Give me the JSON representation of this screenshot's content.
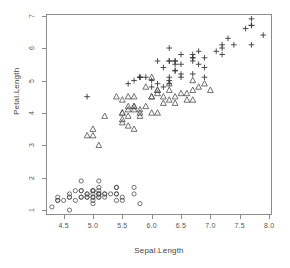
{
  "chart_data": {
    "type": "scatter",
    "title": "",
    "xlabel": "Sepal.Length",
    "ylabel": "Petal.Length",
    "xlim": [
      4.2,
      8.05
    ],
    "ylim": [
      0.85,
      7.05
    ],
    "grid": false,
    "legend": "none",
    "xticks": [
      "4.5",
      "5.0",
      "5.5",
      "6.0",
      "6.5",
      "7.0",
      "7.5",
      "8.0"
    ],
    "xtick_values": [
      4.5,
      5.0,
      5.5,
      6.0,
      6.5,
      7.0,
      7.5,
      8.0
    ],
    "yticks": [
      "1",
      "2",
      "3",
      "4",
      "5",
      "6",
      "7"
    ],
    "ytick_values": [
      1,
      2,
      3,
      4,
      5,
      6,
      7
    ],
    "series": [
      {
        "name": "setosa",
        "marker": "circle",
        "color": "#4d4d4d",
        "points": [
          [
            5.1,
            1.4
          ],
          [
            4.9,
            1.4
          ],
          [
            4.7,
            1.3
          ],
          [
            4.6,
            1.5
          ],
          [
            5.0,
            1.4
          ],
          [
            5.4,
            1.7
          ],
          [
            4.6,
            1.4
          ],
          [
            5.0,
            1.5
          ],
          [
            4.4,
            1.4
          ],
          [
            4.9,
            1.5
          ],
          [
            5.4,
            1.5
          ],
          [
            4.8,
            1.6
          ],
          [
            4.8,
            1.4
          ],
          [
            4.3,
            1.1
          ],
          [
            5.8,
            1.2
          ],
          [
            5.7,
            1.5
          ],
          [
            5.4,
            1.3
          ],
          [
            5.1,
            1.4
          ],
          [
            5.7,
            1.7
          ],
          [
            5.1,
            1.5
          ],
          [
            5.4,
            1.7
          ],
          [
            5.1,
            1.5
          ],
          [
            4.6,
            1.0
          ],
          [
            5.1,
            1.7
          ],
          [
            4.8,
            1.9
          ],
          [
            5.0,
            1.6
          ],
          [
            5.0,
            1.6
          ],
          [
            5.2,
            1.5
          ],
          [
            5.2,
            1.4
          ],
          [
            4.7,
            1.6
          ],
          [
            4.8,
            1.6
          ],
          [
            5.4,
            1.5
          ],
          [
            5.2,
            1.5
          ],
          [
            5.5,
            1.4
          ],
          [
            4.9,
            1.5
          ],
          [
            5.0,
            1.2
          ],
          [
            5.5,
            1.3
          ],
          [
            4.9,
            1.4
          ],
          [
            4.4,
            1.3
          ],
          [
            5.1,
            1.5
          ],
          [
            5.0,
            1.3
          ],
          [
            4.5,
            1.3
          ],
          [
            4.4,
            1.3
          ],
          [
            5.0,
            1.6
          ],
          [
            5.1,
            1.9
          ],
          [
            4.8,
            1.4
          ],
          [
            5.1,
            1.6
          ],
          [
            4.6,
            1.4
          ],
          [
            5.3,
            1.5
          ],
          [
            5.0,
            1.4
          ]
        ]
      },
      {
        "name": "versicolor",
        "marker": "triangle",
        "color": "#4d4d4d",
        "points": [
          [
            7.0,
            4.7
          ],
          [
            6.4,
            4.5
          ],
          [
            6.9,
            4.9
          ],
          [
            5.5,
            4.0
          ],
          [
            6.5,
            4.6
          ],
          [
            5.7,
            4.5
          ],
          [
            6.3,
            4.7
          ],
          [
            4.9,
            3.3
          ],
          [
            6.6,
            4.6
          ],
          [
            5.2,
            3.9
          ],
          [
            5.0,
            3.5
          ],
          [
            5.9,
            4.2
          ],
          [
            6.0,
            4.0
          ],
          [
            6.1,
            4.7
          ],
          [
            5.6,
            3.6
          ],
          [
            6.7,
            4.4
          ],
          [
            5.6,
            4.5
          ],
          [
            5.8,
            4.1
          ],
          [
            6.2,
            4.5
          ],
          [
            5.6,
            3.9
          ],
          [
            5.9,
            4.8
          ],
          [
            6.1,
            4.0
          ],
          [
            6.3,
            4.9
          ],
          [
            6.1,
            4.7
          ],
          [
            6.4,
            4.3
          ],
          [
            6.6,
            4.4
          ],
          [
            6.8,
            4.8
          ],
          [
            6.7,
            5.0
          ],
          [
            6.0,
            4.5
          ],
          [
            5.7,
            3.5
          ],
          [
            5.5,
            3.8
          ],
          [
            5.5,
            3.7
          ],
          [
            5.8,
            3.9
          ],
          [
            6.0,
            5.1
          ],
          [
            5.4,
            4.5
          ],
          [
            6.0,
            4.5
          ],
          [
            6.7,
            4.7
          ],
          [
            6.3,
            4.4
          ],
          [
            5.6,
            4.1
          ],
          [
            5.5,
            4.0
          ],
          [
            5.5,
            4.4
          ],
          [
            6.1,
            4.6
          ],
          [
            5.8,
            4.0
          ],
          [
            5.0,
            3.3
          ],
          [
            5.6,
            4.2
          ],
          [
            5.7,
            4.2
          ],
          [
            5.7,
            4.2
          ],
          [
            6.2,
            4.3
          ],
          [
            5.1,
            3.0
          ],
          [
            5.7,
            4.1
          ]
        ]
      },
      {
        "name": "virginica",
        "marker": "plus",
        "color": "#3a3a3a",
        "points": [
          [
            6.3,
            6.0
          ],
          [
            5.8,
            5.1
          ],
          [
            7.1,
            5.9
          ],
          [
            6.3,
            5.6
          ],
          [
            6.5,
            5.8
          ],
          [
            7.6,
            6.6
          ],
          [
            4.9,
            4.5
          ],
          [
            7.3,
            6.3
          ],
          [
            6.7,
            5.8
          ],
          [
            7.2,
            6.1
          ],
          [
            6.5,
            5.1
          ],
          [
            6.4,
            5.3
          ],
          [
            6.8,
            5.5
          ],
          [
            5.7,
            5.0
          ],
          [
            5.8,
            5.1
          ],
          [
            6.4,
            5.3
          ],
          [
            6.5,
            5.5
          ],
          [
            7.7,
            6.7
          ],
          [
            7.7,
            6.9
          ],
          [
            6.0,
            5.0
          ],
          [
            6.9,
            5.7
          ],
          [
            5.6,
            4.9
          ],
          [
            7.7,
            6.7
          ],
          [
            6.3,
            4.9
          ],
          [
            6.7,
            5.7
          ],
          [
            7.2,
            6.0
          ],
          [
            6.2,
            4.8
          ],
          [
            6.1,
            4.9
          ],
          [
            6.4,
            5.6
          ],
          [
            7.2,
            5.8
          ],
          [
            7.4,
            6.1
          ],
          [
            7.9,
            6.4
          ],
          [
            6.4,
            5.6
          ],
          [
            6.3,
            5.1
          ],
          [
            6.1,
            5.6
          ],
          [
            7.7,
            6.1
          ],
          [
            6.3,
            5.6
          ],
          [
            6.4,
            5.5
          ],
          [
            6.0,
            4.8
          ],
          [
            6.9,
            5.4
          ],
          [
            6.7,
            5.6
          ],
          [
            6.9,
            5.1
          ],
          [
            5.8,
            5.1
          ],
          [
            6.8,
            5.9
          ],
          [
            6.7,
            5.7
          ],
          [
            6.7,
            5.2
          ],
          [
            6.3,
            5.0
          ],
          [
            6.5,
            5.2
          ],
          [
            6.2,
            5.4
          ],
          [
            5.9,
            5.1
          ]
        ]
      }
    ]
  }
}
